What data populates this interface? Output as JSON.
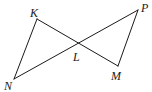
{
  "diagram": {
    "type": "geometry-figure",
    "points": [
      {
        "id": "K",
        "label": "K"
      },
      {
        "id": "N",
        "label": "N"
      },
      {
        "id": "L",
        "label": "L"
      },
      {
        "id": "P",
        "label": "P"
      },
      {
        "id": "M",
        "label": "M"
      }
    ],
    "segments": [
      {
        "from": "K",
        "to": "N"
      },
      {
        "from": "K",
        "to": "M"
      },
      {
        "from": "N",
        "to": "P"
      },
      {
        "from": "P",
        "to": "M"
      }
    ],
    "intersection": {
      "point": "L",
      "of": [
        "KM",
        "NP"
      ]
    },
    "colors": {
      "stroke": "#1a1a1a",
      "background": "#ffffff"
    }
  }
}
